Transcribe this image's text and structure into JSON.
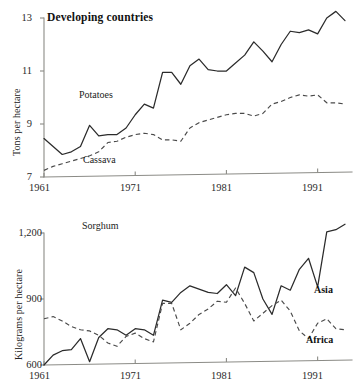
{
  "chart_data": [
    {
      "type": "line",
      "title": "Developing countries",
      "xlabel": "",
      "ylabel": "Tons per hectare",
      "xlim": [
        1961,
        1994
      ],
      "ylim": [
        7,
        13
      ],
      "ytick_labels": [
        "13",
        "11",
        "9",
        "7"
      ],
      "ytick_values": [
        13,
        11,
        9,
        7
      ],
      "xtick_labels": [
        "1961",
        "1971",
        "1981",
        "1991"
      ],
      "xtick_values": [
        1961,
        1971,
        1981,
        1991
      ],
      "grid": false,
      "legend": "inline-annotations",
      "x": [
        1961,
        1962,
        1963,
        1964,
        1965,
        1966,
        1967,
        1968,
        1969,
        1970,
        1971,
        1972,
        1973,
        1974,
        1975,
        1976,
        1977,
        1978,
        1979,
        1980,
        1981,
        1982,
        1983,
        1984,
        1985,
        1986,
        1987,
        1988,
        1989,
        1990,
        1991,
        1992,
        1993,
        1994
      ],
      "series": [
        {
          "name": "Potatoes",
          "style": "solid",
          "values": [
            8.45,
            8.15,
            7.85,
            7.95,
            8.15,
            8.95,
            8.55,
            8.6,
            8.6,
            8.85,
            9.35,
            9.75,
            9.6,
            10.95,
            10.95,
            10.5,
            11.2,
            11.45,
            11.05,
            11.0,
            11.0,
            11.3,
            11.6,
            12.1,
            11.75,
            11.35,
            12.0,
            12.5,
            12.45,
            12.55,
            12.4,
            13.0,
            13.25,
            12.9
          ]
        },
        {
          "name": "Cassava",
          "style": "dashed",
          "values": [
            7.25,
            7.4,
            7.5,
            7.6,
            7.7,
            7.8,
            7.95,
            8.3,
            8.35,
            8.5,
            8.6,
            8.65,
            8.6,
            8.4,
            8.4,
            8.35,
            8.85,
            9.05,
            9.15,
            9.25,
            9.35,
            9.4,
            9.4,
            9.3,
            9.4,
            9.75,
            9.85,
            10.0,
            10.1,
            10.05,
            10.1,
            9.8,
            9.8,
            9.75
          ]
        }
      ]
    },
    {
      "type": "line",
      "title": "Sorghum",
      "xlabel": "",
      "ylabel": "Kilograms per hectare",
      "xlim": [
        1961,
        1994
      ],
      "ylim": [
        600,
        1200
      ],
      "ytick_labels": [
        "1,200",
        "900",
        "600"
      ],
      "ytick_values": [
        1200,
        900,
        600
      ],
      "xtick_labels": [
        "1961",
        "1971",
        "1981",
        "1991"
      ],
      "xtick_values": [
        1961,
        1971,
        1981,
        1991
      ],
      "grid": false,
      "legend": "inline-annotations",
      "x": [
        1961,
        1962,
        1963,
        1964,
        1965,
        1966,
        1967,
        1968,
        1969,
        1970,
        1971,
        1972,
        1973,
        1974,
        1975,
        1976,
        1977,
        1978,
        1979,
        1980,
        1981,
        1982,
        1983,
        1984,
        1985,
        1986,
        1987,
        1988,
        1989,
        1990,
        1991,
        1992,
        1993,
        1994
      ],
      "series": [
        {
          "name": "Asia",
          "style": "solid",
          "values": [
            600,
            645,
            665,
            670,
            720,
            615,
            725,
            765,
            760,
            735,
            765,
            760,
            735,
            895,
            885,
            930,
            960,
            945,
            930,
            925,
            965,
            915,
            1045,
            1020,
            900,
            830,
            960,
            940,
            1035,
            1085,
            955,
            1205,
            1215,
            1240
          ]
        },
        {
          "name": "Africa",
          "style": "dashed",
          "values": [
            810,
            820,
            800,
            775,
            760,
            755,
            735,
            700,
            685,
            730,
            745,
            720,
            705,
            880,
            880,
            760,
            790,
            830,
            855,
            890,
            885,
            950,
            880,
            800,
            835,
            870,
            895,
            845,
            755,
            720,
            790,
            810,
            765,
            760
          ]
        }
      ]
    }
  ]
}
